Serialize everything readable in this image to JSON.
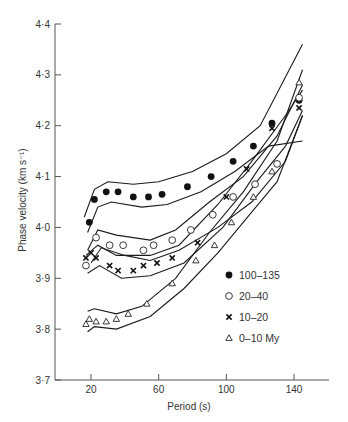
{
  "chart_data": {
    "type": "scatter",
    "title": "",
    "xlabel": "Period (s)",
    "ylabel": "Phase velocity (km s⁻¹)",
    "xlim": [
      15,
      158
    ],
    "ylim": [
      3.7,
      4.4
    ],
    "grid": false,
    "legend_position": "lower right inside",
    "x_ticks": [
      20,
      60,
      100,
      140
    ],
    "x_tick_labels": [
      "20",
      "60",
      "100",
      "140"
    ],
    "y_ticks": [
      3.7,
      3.8,
      3.9,
      4.0,
      4.1,
      4.2,
      4.3,
      4.4
    ],
    "y_tick_labels": [
      "3·7",
      "3·8",
      "3·9",
      "4·0",
      "4·1",
      "4·2",
      "4·3",
      "4·4"
    ],
    "series": [
      {
        "name": "100–135",
        "marker": "filled-circle",
        "points": [
          [
            19,
            4.01
          ],
          [
            22,
            4.055
          ],
          [
            29,
            4.07
          ],
          [
            36,
            4.07
          ],
          [
            45,
            4.06
          ],
          [
            54,
            4.06
          ],
          [
            62,
            4.065
          ],
          [
            77,
            4.08
          ],
          [
            91,
            4.1
          ],
          [
            104,
            4.13
          ],
          [
            116,
            4.16
          ],
          [
            127,
            4.205
          ],
          [
            143,
            4.25
          ]
        ],
        "band_upper": [
          [
            16,
            4.02
          ],
          [
            22,
            4.075
          ],
          [
            30,
            4.09
          ],
          [
            45,
            4.085
          ],
          [
            60,
            4.09
          ],
          [
            80,
            4.11
          ],
          [
            100,
            4.145
          ],
          [
            120,
            4.2
          ],
          [
            145,
            4.36
          ]
        ],
        "band_lower": [
          [
            18,
            3.99
          ],
          [
            24,
            4.04
          ],
          [
            32,
            4.05
          ],
          [
            50,
            4.04
          ],
          [
            65,
            4.045
          ],
          [
            85,
            4.07
          ],
          [
            105,
            4.11
          ],
          [
            125,
            4.16
          ],
          [
            145,
            4.17
          ]
        ]
      },
      {
        "name": "20–40",
        "marker": "open-circle",
        "points": [
          [
            17,
            3.925
          ],
          [
            23,
            3.98
          ],
          [
            31,
            3.965
          ],
          [
            39,
            3.965
          ],
          [
            51,
            3.955
          ],
          [
            57,
            3.965
          ],
          [
            68,
            3.975
          ],
          [
            79,
            3.995
          ],
          [
            92,
            4.025
          ],
          [
            104,
            4.06
          ],
          [
            117,
            4.085
          ],
          [
            130,
            4.125
          ],
          [
            143,
            4.255
          ]
        ],
        "band_upper": [
          [
            18,
            3.955
          ],
          [
            24,
            3.995
          ],
          [
            35,
            3.985
          ],
          [
            55,
            3.975
          ],
          [
            70,
            3.995
          ],
          [
            90,
            4.05
          ],
          [
            110,
            4.1
          ],
          [
            130,
            4.18
          ],
          [
            145,
            4.28
          ]
        ],
        "band_lower": [
          [
            20,
            3.93
          ],
          [
            26,
            3.96
          ],
          [
            40,
            3.945
          ],
          [
            55,
            3.935
          ],
          [
            72,
            3.955
          ],
          [
            95,
            4.0
          ],
          [
            115,
            4.05
          ],
          [
            135,
            4.13
          ],
          [
            145,
            4.22
          ]
        ]
      },
      {
        "name": "10–20",
        "marker": "cross",
        "points": [
          [
            17,
            3.94
          ],
          [
            20,
            3.95
          ],
          [
            23,
            3.94
          ],
          [
            31,
            3.925
          ],
          [
            36,
            3.915
          ],
          [
            45,
            3.915
          ],
          [
            51,
            3.925
          ],
          [
            59,
            3.93
          ],
          [
            68,
            3.94
          ],
          [
            83,
            3.97
          ],
          [
            100,
            4.06
          ],
          [
            112,
            4.115
          ],
          [
            127,
            4.195
          ],
          [
            143,
            4.235
          ]
        ],
        "band_upper": [
          [
            17,
            3.945
          ],
          [
            24,
            3.965
          ],
          [
            35,
            3.945
          ],
          [
            55,
            3.945
          ],
          [
            72,
            3.965
          ],
          [
            95,
            4.045
          ],
          [
            115,
            4.13
          ],
          [
            135,
            4.22
          ],
          [
            145,
            4.27
          ]
        ],
        "band_lower": [
          [
            18,
            3.91
          ],
          [
            25,
            3.925
          ],
          [
            38,
            3.9
          ],
          [
            55,
            3.905
          ],
          [
            75,
            3.93
          ],
          [
            98,
            4.0
          ],
          [
            118,
            4.09
          ],
          [
            135,
            4.16
          ],
          [
            145,
            4.23
          ]
        ]
      },
      {
        "name": "0–10 My",
        "marker": "open-triangle",
        "points": [
          [
            17,
            3.81
          ],
          [
            19,
            3.82
          ],
          [
            23,
            3.815
          ],
          [
            29,
            3.815
          ],
          [
            35,
            3.82
          ],
          [
            42,
            3.83
          ],
          [
            53,
            3.85
          ],
          [
            68,
            3.89
          ],
          [
            82,
            3.935
          ],
          [
            93,
            3.965
          ],
          [
            103,
            4.01
          ],
          [
            116,
            4.06
          ],
          [
            127,
            4.11
          ],
          [
            143,
            4.285
          ]
        ],
        "band_upper": [
          [
            18,
            3.835
          ],
          [
            22,
            3.84
          ],
          [
            35,
            3.83
          ],
          [
            50,
            3.845
          ],
          [
            70,
            3.9
          ],
          [
            90,
            3.99
          ],
          [
            110,
            4.07
          ],
          [
            130,
            4.17
          ],
          [
            145,
            4.31
          ]
        ],
        "band_lower": [
          [
            18,
            3.795
          ],
          [
            22,
            3.805
          ],
          [
            35,
            3.8
          ],
          [
            55,
            3.825
          ],
          [
            75,
            3.88
          ],
          [
            95,
            3.95
          ],
          [
            115,
            4.03
          ],
          [
            130,
            4.09
          ],
          [
            145,
            4.22
          ]
        ]
      }
    ]
  },
  "legend": {
    "items": [
      {
        "label": "100–135",
        "marker": "filled-circle"
      },
      {
        "label": "20–40",
        "marker": "open-circle"
      },
      {
        "label": "10–20",
        "marker": "cross"
      },
      {
        "label": "0–10 My",
        "marker": "open-triangle"
      }
    ]
  }
}
